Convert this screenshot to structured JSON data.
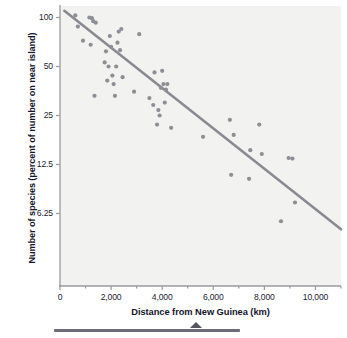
{
  "chart_data": {
    "type": "scatter",
    "title": "",
    "xlabel": "Distance from New Guinea (km)",
    "ylabel": "Number of species (percent of number on near island)",
    "xlim": [
      0,
      11000
    ],
    "ylim_log": [
      4.6,
      115
    ],
    "yscale": "log2",
    "xticks": [
      0,
      2000,
      4000,
      6000,
      8000,
      10000
    ],
    "xticklabels": [
      "0",
      "2,000",
      "4,000",
      "6,000",
      "8,000",
      "10,000"
    ],
    "yticks": [
      100,
      50,
      25,
      12.5,
      6.25
    ],
    "yticklabels": [
      "100",
      "50",
      "25",
      "12.5",
      "6.25"
    ],
    "grid": false,
    "legend": false,
    "point_color": "#8e8e96",
    "line_color": "#8a8a92",
    "plot_bg": "#f2f2f0",
    "axis_color": "#9a9a9f",
    "points": [
      [
        600,
        103
      ],
      [
        700,
        88
      ],
      [
        900,
        72
      ],
      [
        1150,
        100
      ],
      [
        1200,
        68
      ],
      [
        1250,
        99
      ],
      [
        1300,
        95
      ],
      [
        1350,
        33
      ],
      [
        1400,
        93
      ],
      [
        1750,
        53
      ],
      [
        1800,
        62
      ],
      [
        1850,
        41
      ],
      [
        1900,
        50
      ],
      [
        1950,
        77
      ],
      [
        2000,
        66
      ],
      [
        2050,
        44
      ],
      [
        2100,
        39
      ],
      [
        2150,
        33
      ],
      [
        2200,
        50
      ],
      [
        2250,
        70
      ],
      [
        2300,
        82
      ],
      [
        2350,
        63
      ],
      [
        2400,
        85
      ],
      [
        2450,
        43
      ],
      [
        2900,
        35
      ],
      [
        3100,
        79
      ],
      [
        3500,
        32
      ],
      [
        3650,
        29
      ],
      [
        3700,
        46
      ],
      [
        3800,
        22
      ],
      [
        3850,
        27
      ],
      [
        3900,
        25
      ],
      [
        3950,
        37
      ],
      [
        4000,
        47
      ],
      [
        4050,
        39
      ],
      [
        4100,
        30
      ],
      [
        4150,
        36
      ],
      [
        4200,
        39
      ],
      [
        4350,
        21
      ],
      [
        5600,
        18.5
      ],
      [
        6650,
        23.5
      ],
      [
        6700,
        10.8
      ],
      [
        6800,
        19
      ],
      [
        7400,
        10.2
      ],
      [
        7450,
        15.3
      ],
      [
        7800,
        22
      ],
      [
        7900,
        14.5
      ],
      [
        8650,
        5.6
      ],
      [
        8950,
        13.7
      ],
      [
        9100,
        13.6
      ],
      [
        9200,
        7.3
      ]
    ],
    "trendline": {
      "x_start": 170,
      "y_start": 110,
      "x_end": 11000,
      "y_end": 5.0
    }
  }
}
